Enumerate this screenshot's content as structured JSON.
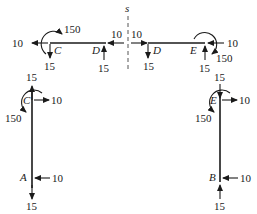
{
  "diagram": {
    "cut_label": "s",
    "top_left_beam": {
      "left_node": "C",
      "right_node": "D",
      "forces": {
        "c_horizontal": "10",
        "c_moment": "150",
        "c_vertical": "15",
        "d_horizontal": "10",
        "d_vertical": "15"
      }
    },
    "top_right_beam": {
      "left_node": "D",
      "right_node": "E",
      "forces": {
        "d_horizontal": "10",
        "d_vertical": "15",
        "e_horizontal": "10",
        "e_moment": "150",
        "e_vertical": "15"
      }
    },
    "left_column": {
      "top_node": "C",
      "bottom_node": "A",
      "forces": {
        "c_vertical": "15",
        "c_horizontal": "10",
        "c_moment": "150",
        "a_horizontal": "10",
        "a_vertical": "15"
      }
    },
    "right_column": {
      "top_node": "E",
      "bottom_node": "B",
      "forces": {
        "e_vertical": "15",
        "e_horizontal": "10",
        "e_moment": "150",
        "b_horizontal": "10",
        "b_vertical": "15"
      }
    },
    "colors": {
      "ink": "#1a1a1a",
      "cut_line": "#555555",
      "background": "#ffffff"
    }
  }
}
